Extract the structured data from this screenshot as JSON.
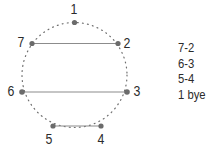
{
  "figure": {
    "type": "round-robin-rotation-diagram",
    "background_color": "#ffffff",
    "circle": {
      "center_x": 74.5,
      "center_y": 75,
      "radius": 52.5,
      "stroke_color": "#6e6e6e",
      "style": "dotted"
    },
    "nodes": [
      {
        "label": "1",
        "x": 74.5,
        "y": 22.5,
        "label_x": 70,
        "label_y": 2,
        "dot_color": "#6b6b6b"
      },
      {
        "label": "2",
        "x": 118,
        "y": 43.5,
        "label_x": 123,
        "label_y": 36,
        "dot_color": "#6b6b6b"
      },
      {
        "label": "3",
        "x": 127,
        "y": 92,
        "label_x": 133,
        "label_y": 84,
        "dot_color": "#6b6b6b"
      },
      {
        "label": "4",
        "x": 101,
        "y": 126,
        "label_x": 97,
        "label_y": 132,
        "dot_color": "#6b6b6b"
      },
      {
        "label": "5",
        "x": 53,
        "y": 126,
        "label_x": 45,
        "label_y": 132,
        "dot_color": "#6b6b6b"
      },
      {
        "label": "6",
        "x": 22,
        "y": 92,
        "label_x": 7,
        "label_y": 84,
        "dot_color": "#6b6b6b"
      },
      {
        "label": "7",
        "x": 32,
        "y": 43.5,
        "label_x": 17,
        "label_y": 35,
        "dot_color": "#6b6b6b"
      }
    ],
    "chords": [
      {
        "name": "chord-7-2",
        "from": "7",
        "to": "2",
        "x1": 32,
        "y1": 43.5,
        "x2": 118,
        "y2": 43.5,
        "color": "#8c8c8c"
      },
      {
        "name": "chord-6-3",
        "from": "6",
        "to": "3",
        "x1": 22,
        "y1": 92,
        "x2": 127,
        "y2": 92,
        "color": "#8c8c8c"
      },
      {
        "name": "chord-5-4",
        "from": "5",
        "to": "4",
        "x1": 53,
        "y1": 126,
        "x2": 101,
        "y2": 126,
        "color": "#8c8c8c"
      }
    ]
  },
  "pairings": {
    "items": [
      {
        "label": "7-2"
      },
      {
        "label": "6-3"
      },
      {
        "label": "5-4"
      },
      {
        "label": "1 bye"
      }
    ]
  }
}
